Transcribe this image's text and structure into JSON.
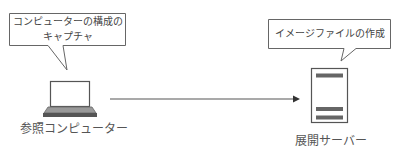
{
  "diagram": {
    "left_node": {
      "label": "参照コンピューター",
      "icon": "laptop-icon",
      "callout": {
        "line1": "コンピューターの構成の",
        "line2": "キャプチャ"
      }
    },
    "right_node": {
      "label": "展開サーバー",
      "icon": "server-icon",
      "callout": {
        "line1": "イメージファイルの作成"
      }
    },
    "connector": {
      "from": "参照コンピューター",
      "to": "展開サーバー",
      "style": "arrow"
    },
    "colors": {
      "stroke": "#555555",
      "fill_dark": "#666666",
      "text": "#555555",
      "background": "#ffffff"
    }
  }
}
